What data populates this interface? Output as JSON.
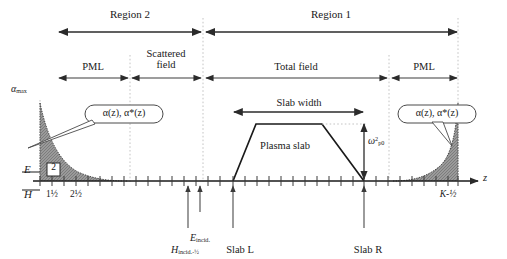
{
  "figure": {
    "type": "fdtd-grid-schematic",
    "axis": {
      "axis_label": "z",
      "field_label_top": "E",
      "field_label_bottom": "H",
      "left_tick_labels": [
        "1½",
        "2½"
      ],
      "right_tick_label": "K-½",
      "cell_box_label": "2"
    },
    "vertical_axis": {
      "max_label": "αmax"
    },
    "regions": [
      {
        "name": "region-2",
        "label": "Region 2"
      },
      {
        "name": "region-1",
        "label": "Region 1"
      }
    ],
    "zones": [
      {
        "name": "pml-left",
        "label": "PML"
      },
      {
        "name": "scattered-field",
        "label": "Scattered\nfield",
        "line1": "Scattered",
        "line2": "field"
      },
      {
        "name": "total-field",
        "label": "Total field"
      },
      {
        "name": "pml-right",
        "label": "PML"
      }
    ],
    "callouts": [
      {
        "name": "alpha-callout-left",
        "text": "α(z), α*(z)"
      },
      {
        "name": "alpha-callout-right",
        "text": "α(z), α*(z)"
      }
    ],
    "slab": {
      "width_label": "Slab width",
      "body_label": "Plasma slab",
      "amplitude_label": "ω²p0",
      "amplitude_base": "ω",
      "amplitude_sup": "2",
      "amplitude_sub": "p0",
      "left_marker": "Slab L",
      "right_marker": "Slab R"
    },
    "source_markers": [
      {
        "name": "h-incident-marker",
        "base": "H",
        "sub": "incid.-½",
        "text": "Hincid.-½"
      },
      {
        "name": "e-incident-marker",
        "base": "E",
        "sub": "incid.",
        "text": "Eincid."
      }
    ],
    "colors": {
      "ink": "#1a1a1a",
      "pml_fill": "#8c8c8c",
      "guide": "#b9b9b9",
      "arrow": "#2b2b2b"
    }
  }
}
